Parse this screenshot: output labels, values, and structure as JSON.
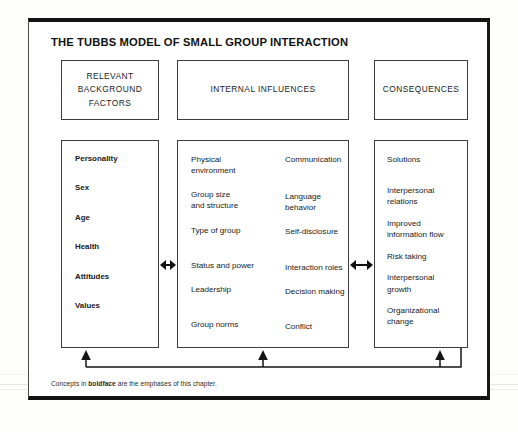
{
  "figure": {
    "title": "THE TUBBS MODEL OF SMALL GROUP INTERACTION",
    "caption_before": "Concepts in ",
    "caption_bold": "boldface",
    "caption_after": " are the emphases of this chapter."
  },
  "headers": {
    "left": "RELEVANT\nBACKGROUND\nFACTORS",
    "left_lines": [
      "RELEVANT",
      "BACKGROUND",
      "FACTORS"
    ],
    "middle": "INTERNAL INFLUENCES",
    "right": "CONSEQUENCES"
  },
  "columns": {
    "relevant_background_factors": {
      "items": [
        "Personality",
        "Sex",
        "Age",
        "Health",
        "Attitudes",
        "Values"
      ]
    },
    "internal_influences": {
      "column_a": [
        "Physical\nenvironment",
        "Group size\nand structure",
        "Type of group",
        "Status and power",
        "Leadership",
        "Group norms"
      ],
      "column_b": [
        "Communication",
        "Language\nbehavior",
        "Self-disclosure",
        "Interaction roles",
        "Decision making",
        "Conflict"
      ]
    },
    "consequences": {
      "items": [
        "Solutions",
        "Interpersonal\nrelations",
        "Improved\ninformation flow",
        "Risk taking",
        "Interpersonal\ngrowth",
        "Organizational\nchange"
      ]
    }
  },
  "connectors": {
    "arrow_left_middle": "double-headed-arrow",
    "arrow_middle_right": "double-headed-arrow",
    "feedback_loop": "feedback-loop-from-consequences-to-all-columns"
  },
  "colors": {
    "ink": "#111111",
    "box_border": "#3c3c3c",
    "frame_border": "#121212",
    "page_background": "#fdfdfc"
  }
}
